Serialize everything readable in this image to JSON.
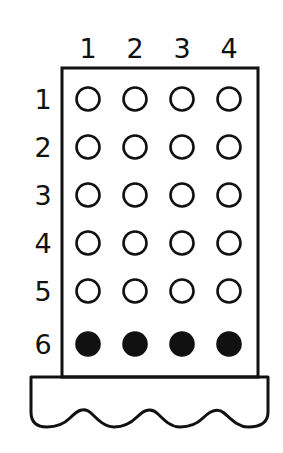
{
  "figure": {
    "background_color": "#ffffff",
    "line_color": "#111111"
  },
  "column_headers": [
    {
      "label": "1",
      "cx": 88
    },
    {
      "label": "2",
      "cx": 135
    },
    {
      "label": "3",
      "cx": 182
    },
    {
      "label": "4",
      "cx": 229
    }
  ],
  "row_headers": [
    {
      "label": "1",
      "cy": 99
    },
    {
      "label": "2",
      "cy": 147
    },
    {
      "label": "3",
      "cy": 195
    },
    {
      "label": "4",
      "cy": 243
    },
    {
      "label": "5",
      "cy": 291
    },
    {
      "label": "6",
      "cy": 344
    }
  ],
  "board": {
    "left": 62,
    "top": 68,
    "right": 258,
    "bottom": 377,
    "radius": 11.5,
    "fill_color": "#111111",
    "empty_color": "#ffffff"
  },
  "cells": [
    {
      "row": 1,
      "col": 1,
      "cx": 88,
      "cy": 99,
      "state": "empty"
    },
    {
      "row": 1,
      "col": 2,
      "cx": 135,
      "cy": 99,
      "state": "empty"
    },
    {
      "row": 1,
      "col": 3,
      "cx": 182,
      "cy": 99,
      "state": "empty"
    },
    {
      "row": 1,
      "col": 4,
      "cx": 229,
      "cy": 99,
      "state": "empty"
    },
    {
      "row": 2,
      "col": 1,
      "cx": 88,
      "cy": 147,
      "state": "empty"
    },
    {
      "row": 2,
      "col": 2,
      "cx": 135,
      "cy": 147,
      "state": "empty"
    },
    {
      "row": 2,
      "col": 3,
      "cx": 182,
      "cy": 147,
      "state": "empty"
    },
    {
      "row": 2,
      "col": 4,
      "cx": 229,
      "cy": 147,
      "state": "empty"
    },
    {
      "row": 3,
      "col": 1,
      "cx": 88,
      "cy": 195,
      "state": "empty"
    },
    {
      "row": 3,
      "col": 2,
      "cx": 135,
      "cy": 195,
      "state": "empty"
    },
    {
      "row": 3,
      "col": 3,
      "cx": 182,
      "cy": 195,
      "state": "empty"
    },
    {
      "row": 3,
      "col": 4,
      "cx": 229,
      "cy": 195,
      "state": "empty"
    },
    {
      "row": 4,
      "col": 1,
      "cx": 88,
      "cy": 243,
      "state": "empty"
    },
    {
      "row": 4,
      "col": 2,
      "cx": 135,
      "cy": 243,
      "state": "empty"
    },
    {
      "row": 4,
      "col": 3,
      "cx": 182,
      "cy": 243,
      "state": "empty"
    },
    {
      "row": 4,
      "col": 4,
      "cx": 229,
      "cy": 243,
      "state": "empty"
    },
    {
      "row": 5,
      "col": 1,
      "cx": 88,
      "cy": 291,
      "state": "empty"
    },
    {
      "row": 5,
      "col": 2,
      "cx": 135,
      "cy": 291,
      "state": "empty"
    },
    {
      "row": 5,
      "col": 3,
      "cx": 182,
      "cy": 291,
      "state": "empty"
    },
    {
      "row": 5,
      "col": 4,
      "cx": 229,
      "cy": 291,
      "state": "empty"
    },
    {
      "row": 6,
      "col": 1,
      "cx": 88,
      "cy": 344,
      "state": "filled"
    },
    {
      "row": 6,
      "col": 2,
      "cx": 135,
      "cy": 344,
      "state": "filled"
    },
    {
      "row": 6,
      "col": 3,
      "cx": 182,
      "cy": 344,
      "state": "filled"
    },
    {
      "row": 6,
      "col": 4,
      "cx": 229,
      "cy": 344,
      "state": "filled"
    }
  ],
  "base": {
    "left": 31,
    "right": 268,
    "top": 377,
    "wave_top_y": 411,
    "wave_bottom_y": 427,
    "wave_bumps": 4,
    "shape_path": "M 31 377 L 268 377 L 268 412 C 268 424 258 427 248 427 C 238 427 231 419 224 413 C 217 407 210 411 203 418 C 196 425 189 427 180 427 C 171 427 165 421 158 414 C 151 407 144 410 137 417 C 130 424 123 427 114 427 C 105 427 98 420 91 413 C 84 406 77 411 70 418 C 63 425 56 427 47 427 C 38 427 31 423 31 412 Z"
  }
}
